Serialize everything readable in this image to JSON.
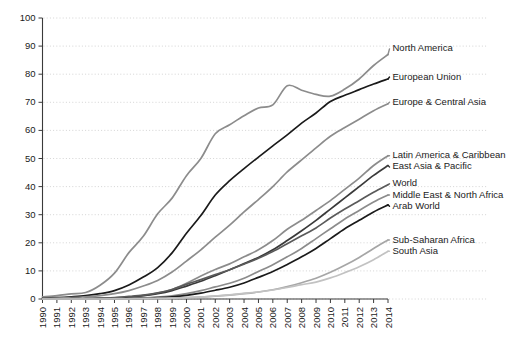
{
  "chart_data": {
    "type": "line",
    "title": "",
    "xlabel": "",
    "ylabel": "",
    "ylim": [
      0,
      100
    ],
    "xlim": [
      1990,
      2014
    ],
    "grid": true,
    "legend_position": "right-inline-labels",
    "ytick_labels": [
      "0",
      "10",
      "20",
      "30",
      "40",
      "50",
      "60",
      "70",
      "80",
      "90",
      "100"
    ],
    "ytick_values": [
      0,
      10,
      20,
      30,
      40,
      50,
      60,
      70,
      80,
      90,
      100
    ],
    "x": [
      1990,
      1991,
      1992,
      1993,
      1994,
      1995,
      1996,
      1997,
      1998,
      1999,
      2000,
      2001,
      2002,
      2003,
      2004,
      2005,
      2006,
      2007,
      2008,
      2009,
      2010,
      2011,
      2012,
      2013,
      2014
    ],
    "xtick_labels": [
      "1990",
      "1991",
      "1992",
      "1993",
      "1994",
      "1995",
      "1996",
      "1997",
      "1998",
      "1999",
      "2000",
      "2001",
      "2002",
      "2003",
      "2004",
      "2005",
      "2006",
      "2007",
      "2008",
      "2009",
      "2010",
      "2011",
      "2012",
      "2013",
      "2014"
    ],
    "series": [
      {
        "name": "North America",
        "color": "#8c8c8c",
        "label_y_value": 89,
        "values": [
          0.8,
          1.2,
          1.8,
          2.3,
          4.9,
          9.2,
          16.5,
          22.3,
          30.3,
          35.9,
          43.9,
          50.0,
          58.8,
          62.0,
          65.2,
          68.0,
          69.1,
          75.9,
          74.3,
          72.8,
          72.2,
          74.7,
          78.3,
          83.1,
          87.0
        ]
      },
      {
        "name": "European Union",
        "color": "#1a1a1a",
        "label_y_value": 79,
        "values": [
          0.3,
          0.5,
          0.8,
          1.2,
          1.9,
          3.0,
          5.0,
          7.8,
          11.2,
          16.4,
          23.4,
          29.7,
          37.0,
          42.1,
          46.4,
          50.5,
          54.5,
          58.4,
          62.6,
          66.2,
          70.3,
          72.5,
          74.5,
          76.5,
          78.3
        ]
      },
      {
        "name": "Europe & Central Asia",
        "color": "#8c8c8c",
        "label_y_value": 70,
        "values": [
          0.2,
          0.3,
          0.5,
          0.8,
          1.2,
          1.9,
          3.0,
          4.6,
          6.6,
          9.6,
          13.5,
          17.5,
          22.0,
          26.3,
          31.0,
          35.4,
          40.0,
          45.2,
          49.5,
          53.8,
          57.9,
          61.0,
          64.0,
          67.0,
          69.5
        ]
      },
      {
        "name": "Latin America & Caribbean",
        "color": "#8c8c8c",
        "label_y_value": 51,
        "values": [
          0.0,
          0.0,
          0.1,
          0.1,
          0.2,
          0.3,
          0.6,
          1.2,
          2.1,
          3.4,
          5.6,
          8.2,
          10.5,
          12.5,
          15.0,
          17.5,
          20.8,
          24.8,
          28.0,
          31.5,
          35.0,
          39.0,
          43.0,
          47.5,
          51.0
        ]
      },
      {
        "name": "East Asia & Pacific",
        "color": "#3a3a3a",
        "label_y_value": 47,
        "values": [
          0.0,
          0.0,
          0.1,
          0.1,
          0.2,
          0.4,
          0.7,
          1.2,
          1.9,
          3.0,
          4.6,
          6.3,
          8.3,
          10.4,
          12.6,
          14.8,
          17.5,
          20.8,
          24.3,
          28.0,
          32.0,
          36.0,
          40.0,
          44.0,
          47.5
        ]
      },
      {
        "name": "World",
        "color": "#5a5a5a",
        "label_y_value": 41,
        "values": [
          0.0,
          0.0,
          0.1,
          0.1,
          0.3,
          0.5,
          0.9,
          1.4,
          2.2,
          3.4,
          5.2,
          6.9,
          8.7,
          10.4,
          12.4,
          14.5,
          16.9,
          19.7,
          22.5,
          25.3,
          28.8,
          32.0,
          35.0,
          38.0,
          40.7
        ]
      },
      {
        "name": "Middle East & North Africa",
        "color": "#8c8c8c",
        "label_y_value": 37,
        "values": [
          0.0,
          0.0,
          0.0,
          0.0,
          0.1,
          0.1,
          0.2,
          0.4,
          0.7,
          1.1,
          1.9,
          3.0,
          4.3,
          5.6,
          7.4,
          9.8,
          12.2,
          15.0,
          18.0,
          21.5,
          25.0,
          28.5,
          31.5,
          34.5,
          37.0
        ]
      },
      {
        "name": "Arab World",
        "color": "#1a1a1a",
        "label_y_value": 33,
        "values": [
          0.0,
          0.0,
          0.0,
          0.0,
          0.0,
          0.1,
          0.2,
          0.3,
          0.5,
          0.8,
          1.3,
          2.1,
          3.1,
          4.2,
          5.7,
          7.7,
          9.8,
          12.3,
          15.0,
          18.0,
          21.5,
          25.0,
          28.0,
          31.0,
          33.5
        ]
      },
      {
        "name": "Sub-Saharan Africa",
        "color": "#a6a6a6",
        "label_y_value": 21,
        "values": [
          0.0,
          0.0,
          0.0,
          0.0,
          0.0,
          0.1,
          0.1,
          0.2,
          0.3,
          0.4,
          0.5,
          0.7,
          1.0,
          1.4,
          1.9,
          2.5,
          3.3,
          4.4,
          5.8,
          7.4,
          9.5,
          12.0,
          14.8,
          18.0,
          21.0
        ]
      },
      {
        "name": "South Asia",
        "color": "#c2c2c2",
        "label_y_value": 17,
        "values": [
          0.0,
          0.0,
          0.0,
          0.0,
          0.0,
          0.0,
          0.0,
          0.1,
          0.1,
          0.2,
          0.5,
          0.7,
          1.1,
          1.5,
          2.0,
          2.5,
          3.2,
          4.1,
          5.1,
          6.0,
          7.5,
          9.4,
          11.5,
          14.0,
          17.0
        ]
      }
    ]
  }
}
